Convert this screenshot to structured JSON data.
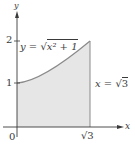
{
  "diagram": {
    "type": "region-under-curve",
    "axes": {
      "x_label": "x",
      "y_label": "y",
      "origin_label": "0",
      "y_ticks": [
        "1",
        "2"
      ],
      "x_tick": "√3"
    },
    "curve": {
      "equation_lhs": "y = ",
      "equation_radicand": "x² + 1",
      "label": "y = √(x² + 1)"
    },
    "boundary": {
      "label_lhs": "x = ",
      "label_radicand": "3",
      "label": "x = √3"
    },
    "colors": {
      "axis": "#3a3a3a",
      "curve": "#8a8a8a",
      "region_fill": "#e6e6e6",
      "boundary_line": "#8a8a8a"
    }
  }
}
